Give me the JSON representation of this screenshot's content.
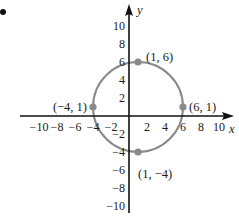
{
  "chart_data": {
    "type": "scatter",
    "title": "",
    "xlabel": "x",
    "ylabel": "y",
    "xlim": [
      -10,
      10
    ],
    "ylim": [
      -10,
      10
    ],
    "grid": false,
    "x_ticks": [
      -10,
      -8,
      -6,
      -4,
      -2,
      2,
      4,
      6,
      8,
      10
    ],
    "y_ticks": [
      10,
      8,
      6,
      4,
      2,
      -2,
      -4,
      -6,
      -8,
      -10
    ],
    "x_tick_labels": [
      "−10",
      "−8",
      "−6",
      "−4",
      "−2",
      "2",
      "4",
      "6",
      "8",
      "10"
    ],
    "y_tick_labels": [
      "10",
      "8",
      "6",
      "4",
      "2",
      "−2",
      "−4",
      "−6",
      "−8",
      "−10"
    ],
    "circle": {
      "center": [
        1,
        1
      ],
      "radius": 5,
      "color": "#8a8a8a"
    },
    "series": [
      {
        "name": "labeled points",
        "color": "#8a8a8a",
        "points": [
          {
            "x": 1,
            "y": 6,
            "label": "(1, 6)"
          },
          {
            "x": -4,
            "y": 1,
            "label": "(−4, 1)"
          },
          {
            "x": 6,
            "y": 1,
            "label": "(6, 1)"
          },
          {
            "x": 1,
            "y": -4,
            "label": "(1, −4)"
          }
        ]
      }
    ],
    "marker": "bullet"
  }
}
